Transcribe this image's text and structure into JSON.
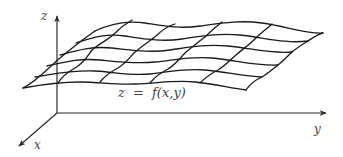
{
  "diagram": {
    "type": "3d-surface-plot",
    "axes": {
      "x": {
        "label": "x"
      },
      "y": {
        "label": "y"
      },
      "z": {
        "label": "z"
      }
    },
    "surface_label": {
      "lhs": "z",
      "equals": "=",
      "rhs": "f(x,y)",
      "full": "z = f(x,y)"
    },
    "colors": {
      "background": "#ffffff",
      "lines": "#1a1a1a",
      "text": "#444444"
    }
  }
}
